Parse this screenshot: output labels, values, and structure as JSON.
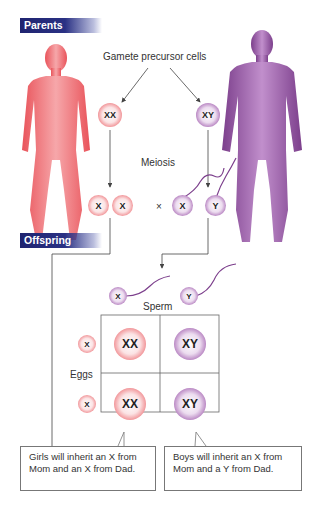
{
  "sections": {
    "parents": "Parents",
    "offspring": "Offspring"
  },
  "labels": {
    "gamete_precursor": "Gamete precursor cells",
    "meiosis": "Meiosis",
    "cross_symbol": "×",
    "sperm": "Sperm",
    "eggs": "Eggs"
  },
  "parents": {
    "mother_cell": "XX",
    "father_cell": "XY"
  },
  "gametes": {
    "mother": [
      "X",
      "X"
    ],
    "father": [
      "X",
      "Y"
    ]
  },
  "punnett": {
    "sperm": [
      "X",
      "Y"
    ],
    "eggs": [
      "X",
      "X"
    ],
    "grid": [
      [
        "XX",
        "XY"
      ],
      [
        "XX",
        "XY"
      ]
    ]
  },
  "notes": {
    "girls": "Girls will inherit an X from Mom and an X from Dad.",
    "boys": "Boys will inherit an X from Mom and a Y from Dad."
  },
  "colors": {
    "banner": "#1f2470",
    "female": "#e8646a",
    "male": "#8b4f9a"
  }
}
